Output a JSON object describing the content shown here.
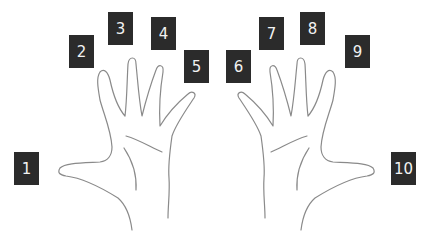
{
  "diagram": {
    "title": "",
    "labels": [
      "1",
      "2",
      "3",
      "4",
      "5",
      "6",
      "7",
      "8",
      "9",
      "10"
    ],
    "left_hand": {
      "fingers": [
        "1",
        "2",
        "3",
        "4",
        "5"
      ]
    },
    "right_hand": {
      "fingers": [
        "6",
        "7",
        "8",
        "9",
        "10"
      ]
    },
    "colors": {
      "label_bg": "#2b2b2b",
      "label_text": "#f2f2f2",
      "outline": "#8a8a8a",
      "background": "#ffffff"
    }
  }
}
